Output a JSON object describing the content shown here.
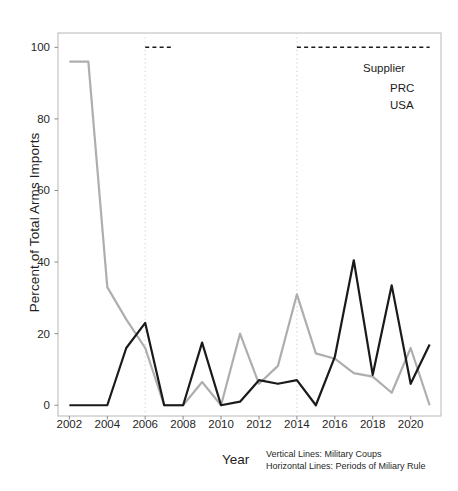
{
  "chart_data": {
    "type": "line",
    "title": "",
    "xlabel": "Year",
    "ylabel": "Percent of Total Arms Imports",
    "x": [
      2002,
      2003,
      2004,
      2005,
      2006,
      2007,
      2008,
      2009,
      2010,
      2011,
      2012,
      2013,
      2014,
      2015,
      2016,
      2017,
      2018,
      2019,
      2020,
      2021
    ],
    "xlim": [
      2001.4,
      2021.6
    ],
    "ylim": [
      -3,
      104
    ],
    "xticks": [
      2002,
      2004,
      2006,
      2008,
      2010,
      2012,
      2014,
      2016,
      2018,
      2020
    ],
    "yticks": [
      0,
      20,
      40,
      60,
      80,
      100
    ],
    "grid": false,
    "legend_position": "top-right",
    "series": [
      {
        "name": "PRC",
        "color": "#1a1a1a",
        "values": [
          0,
          0,
          0,
          16,
          23,
          0,
          0,
          17.5,
          0,
          1,
          7,
          6,
          7,
          0,
          13.5,
          40.5,
          8.5,
          33.5,
          6,
          17
        ]
      },
      {
        "name": "USA",
        "color": "#aeaeae",
        "values": [
          96,
          96,
          33,
          24,
          16,
          0,
          0,
          6.5,
          0,
          20,
          6,
          11,
          31,
          14.5,
          13,
          9,
          8,
          3.5,
          16,
          0
        ]
      }
    ],
    "vertical_lines": {
      "label": "Military Coups",
      "color": "#d8d8d8",
      "style": "dotted",
      "x": [
        2006,
        2014
      ]
    },
    "horizontal_lines": {
      "label": "Periods of Miliary Rule",
      "color": "#1a1a1a",
      "style": "dashed",
      "y": 100,
      "segments": [
        {
          "start": 2006,
          "end": 2007.5
        },
        {
          "start": 2014,
          "end": 2021
        }
      ]
    }
  },
  "legend": {
    "title": "Supplier",
    "items": [
      {
        "label": "PRC",
        "color": "#1a1a1a"
      },
      {
        "label": "USA",
        "color": "#aeaeae"
      }
    ]
  },
  "axis": {
    "x_title": "Year",
    "y_title": "Percent of Total Arms Imports",
    "x_tick_labels": [
      "2002",
      "2004",
      "2006",
      "2008",
      "2010",
      "2012",
      "2014",
      "2016",
      "2018",
      "2020"
    ],
    "y_tick_labels": [
      "0",
      "20",
      "40",
      "60",
      "80",
      "100"
    ]
  },
  "caption": {
    "line1": "Vertical Lines: Military Coups",
    "line2": "Horizontal Lines: Periods of Miliary Rule"
  }
}
